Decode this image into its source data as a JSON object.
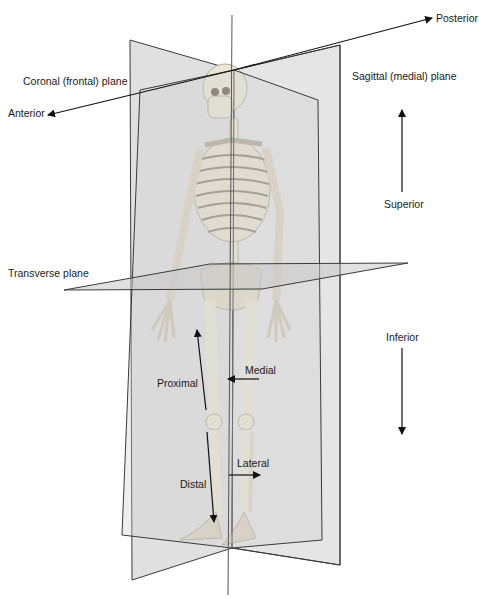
{
  "planes": {
    "coronal": "Coronal (frontal) plane",
    "sagittal": "Sagittal (medial) plane",
    "transverse": "Transverse plane"
  },
  "directions": {
    "anterior": "Anterior",
    "posterior": "Posterior",
    "superior": "Superior",
    "inferior": "Inferior",
    "proximal": "Proximal",
    "distal": "Distal",
    "medial": "Medial",
    "lateral": "Lateral"
  },
  "colors": {
    "plane_fill": "#d9d9d9",
    "plane_edge": "#3a3a3a",
    "bone": "#ece6d6",
    "bone_shadow": "#b9b1a0",
    "text": "#1a1a1a"
  }
}
